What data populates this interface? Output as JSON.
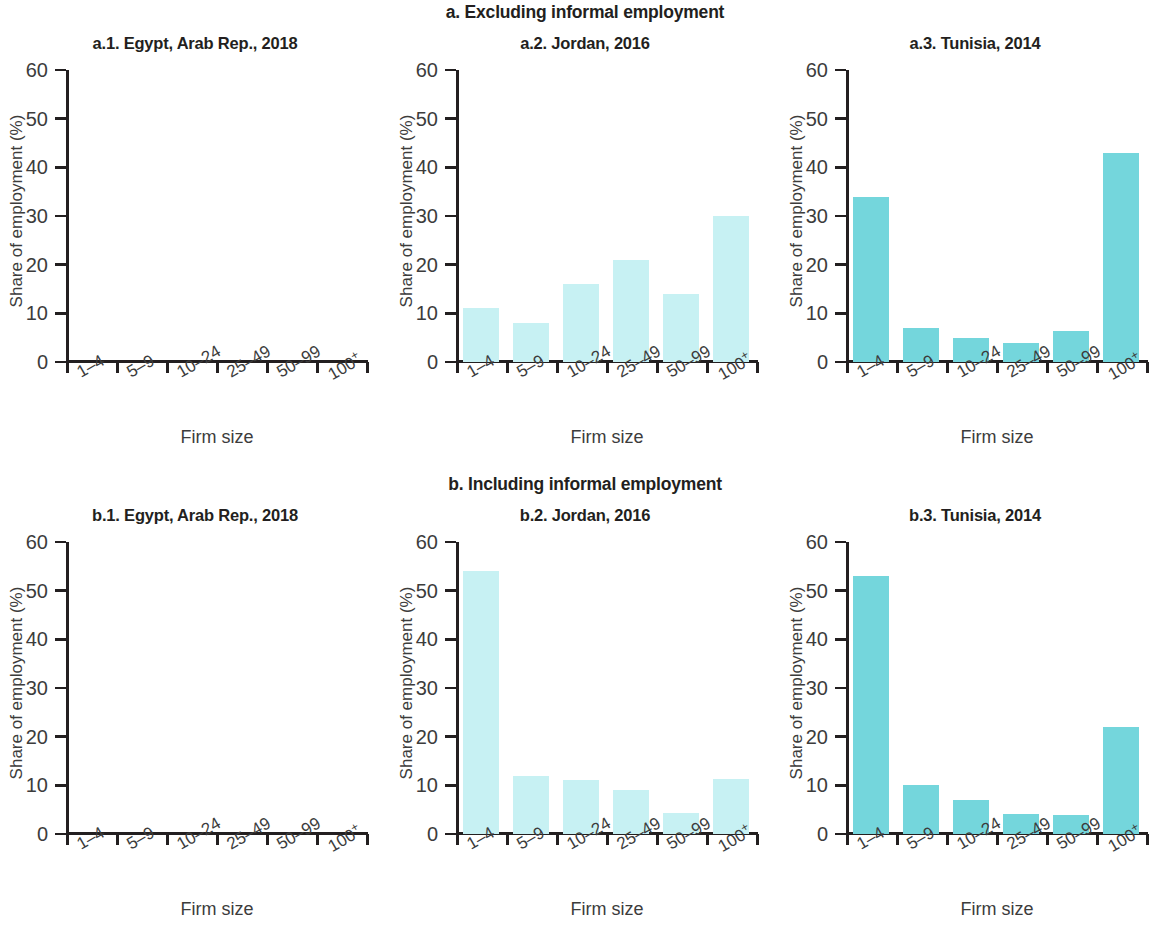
{
  "figure": {
    "axis_color": "#231f20",
    "text_color": "#3c3c3c",
    "bar_color_light": "#c7f1f3",
    "bar_color_strong": "#74d6dc"
  },
  "sections": [
    {
      "key": "a",
      "title": "a. Excluding informal employment"
    },
    {
      "key": "b",
      "title": "b. Including informal employment"
    }
  ],
  "axis": {
    "ylabel": "Share of employment (%)",
    "xlabel": "Firm size",
    "yticks": [
      "60",
      "50",
      "40",
      "30",
      "20",
      "10",
      "0"
    ],
    "categories": [
      "1–4",
      "5–9",
      "10–24",
      "25–49",
      "50–99",
      "100"
    ],
    "last_category_suffix": "+",
    "ymin": 0,
    "ymax": 60
  },
  "chart_data": [
    {
      "type": "bar",
      "panel": "a.1",
      "title": "a.1. Egypt, Arab Rep., 2018",
      "categories": [
        "1–4",
        "5–9",
        "10–24",
        "25–49",
        "50–99",
        "100+"
      ],
      "values": [
        null,
        null,
        null,
        null,
        null,
        null
      ],
      "xlabel": "Firm size",
      "ylabel": "Share of employment (%)",
      "ylim": [
        0,
        60
      ],
      "grid": false,
      "color": "#c7f1f3",
      "note": "no bars rendered in source image"
    },
    {
      "type": "bar",
      "panel": "a.2",
      "title": "a.2. Jordan, 2016",
      "categories": [
        "1–4",
        "5–9",
        "10–24",
        "25–49",
        "50–99",
        "100+"
      ],
      "values": [
        11,
        8,
        16,
        21,
        14,
        30
      ],
      "xlabel": "Firm size",
      "ylabel": "Share of employment (%)",
      "ylim": [
        0,
        60
      ],
      "grid": false,
      "color": "#c7f1f3"
    },
    {
      "type": "bar",
      "panel": "a.3",
      "title": "a.3. Tunisia, 2014",
      "categories": [
        "1–4",
        "5–9",
        "10–24",
        "25–49",
        "50–99",
        "100+"
      ],
      "values": [
        34,
        7,
        5,
        4,
        6.3,
        43
      ],
      "xlabel": "Firm size",
      "ylabel": "Share of employment (%)",
      "ylim": [
        0,
        60
      ],
      "grid": false,
      "color": "#74d6dc"
    },
    {
      "type": "bar",
      "panel": "b.1",
      "title": "b.1. Egypt, Arab Rep., 2018",
      "categories": [
        "1–4",
        "5–9",
        "10–24",
        "25–49",
        "50–99",
        "100+"
      ],
      "values": [
        null,
        null,
        null,
        null,
        null,
        null
      ],
      "xlabel": "Firm size",
      "ylabel": "Share of employment (%)",
      "ylim": [
        0,
        60
      ],
      "grid": false,
      "color": "#c7f1f3",
      "note": "no bars rendered in source image"
    },
    {
      "type": "bar",
      "panel": "b.2",
      "title": "b.2. Jordan, 2016",
      "categories": [
        "1–4",
        "5–9",
        "10–24",
        "25–49",
        "50–99",
        "100+"
      ],
      "values": [
        54,
        12,
        11,
        9,
        4.3,
        11.3
      ],
      "xlabel": "Firm size",
      "ylabel": "Share of employment (%)",
      "ylim": [
        0,
        60
      ],
      "grid": false,
      "color": "#c7f1f3"
    },
    {
      "type": "bar",
      "panel": "b.3",
      "title": "b.3. Tunisia, 2014",
      "categories": [
        "1–4",
        "5–9",
        "10–24",
        "25–49",
        "50–99",
        "100+"
      ],
      "values": [
        53,
        10,
        7,
        4.2,
        4,
        22
      ],
      "xlabel": "Firm size",
      "ylabel": "Share of employment (%)",
      "ylim": [
        0,
        60
      ],
      "grid": false,
      "color": "#74d6dc"
    }
  ]
}
